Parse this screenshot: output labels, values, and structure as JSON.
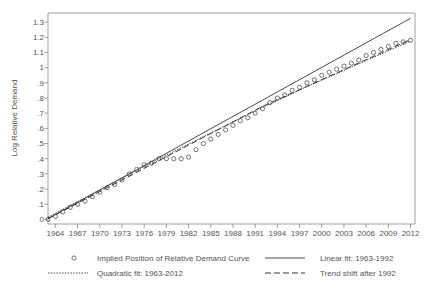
{
  "chart_data": {
    "type": "scatter",
    "title": "",
    "xlabel": "",
    "ylabel": "Log Relative Demand",
    "xlim": [
      1963,
      2012.6
    ],
    "ylim": [
      -0.03,
      1.36
    ],
    "grid": false,
    "legend_position": "bottom",
    "xticks": [
      1964,
      1967,
      1970,
      1973,
      1976,
      1979,
      1982,
      1985,
      1988,
      1991,
      1994,
      1997,
      2000,
      2003,
      2006,
      2009,
      2012
    ],
    "yticks": [
      "0",
      ".1",
      ".2",
      ".3",
      ".4",
      ".5",
      ".6",
      ".7",
      ".8",
      ".9",
      "1",
      "1.1",
      "1.2",
      "1.3"
    ],
    "ytick_values": [
      0,
      0.1,
      0.2,
      0.3,
      0.4,
      0.5,
      0.6,
      0.7,
      0.8,
      0.9,
      1.0,
      1.1,
      1.2,
      1.3
    ],
    "series": [
      {
        "name": "Implied Position of Relative Demand Curve",
        "type": "scatter",
        "marker": "circle-open",
        "x": [
          1963,
          1964,
          1965,
          1966,
          1967,
          1968,
          1969,
          1970,
          1971,
          1972,
          1973,
          1974,
          1975,
          1976,
          1977,
          1978,
          1979,
          1980,
          1981,
          1982,
          1983,
          1984,
          1985,
          1986,
          1987,
          1988,
          1989,
          1990,
          1991,
          1992,
          1993,
          1994,
          1995,
          1996,
          1997,
          1998,
          1999,
          2000,
          2001,
          2002,
          2003,
          2004,
          2005,
          2006,
          2007,
          2008,
          2009,
          2010,
          2011,
          2012
        ],
        "y": [
          0.0,
          0.02,
          0.05,
          0.08,
          0.1,
          0.12,
          0.15,
          0.18,
          0.21,
          0.23,
          0.26,
          0.3,
          0.33,
          0.36,
          0.37,
          0.4,
          0.4,
          0.4,
          0.4,
          0.41,
          0.46,
          0.5,
          0.53,
          0.56,
          0.59,
          0.62,
          0.65,
          0.67,
          0.7,
          0.73,
          0.77,
          0.8,
          0.82,
          0.85,
          0.87,
          0.9,
          0.92,
          0.95,
          0.97,
          0.99,
          1.01,
          1.03,
          1.05,
          1.08,
          1.1,
          1.12,
          1.14,
          1.16,
          1.17,
          1.18
        ]
      },
      {
        "name": "Linear fit: 1963-1992",
        "type": "line",
        "style": "solid",
        "x": [
          1963,
          2012
        ],
        "y": [
          0.005,
          1.325
        ]
      },
      {
        "name": "Quadratic fit: 1963-2012",
        "type": "line",
        "style": "dotted",
        "x": [
          1963,
          1970,
          1977,
          1984,
          1991,
          1998,
          2005,
          2012
        ],
        "y": [
          0.015,
          0.195,
          0.375,
          0.545,
          0.715,
          0.875,
          1.025,
          1.175
        ]
      },
      {
        "name": "Trend shift after 1992",
        "type": "line",
        "style": "dashed",
        "x": [
          1963,
          1992,
          2012
        ],
        "y": [
          0.005,
          0.745,
          1.185
        ]
      }
    ],
    "legend": [
      {
        "label": "Implied Position of Relative Demand Curve",
        "marker": "circle-open"
      },
      {
        "label": "Linear fit: 1963-1992",
        "marker": "line-solid"
      },
      {
        "label": "Quadratic fit: 1963-2012",
        "marker": "line-dotted"
      },
      {
        "label": "Trend shift after 1992",
        "marker": "line-dashed"
      }
    ]
  }
}
